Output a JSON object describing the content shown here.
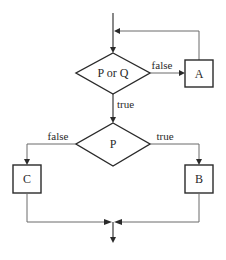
{
  "diagram": {
    "type": "flowchart",
    "nodes": {
      "decision_1": {
        "label": "P or Q",
        "shape": "diamond"
      },
      "decision_2": {
        "label": "P",
        "shape": "diamond"
      },
      "process_a": {
        "label": "A",
        "shape": "rectangle"
      },
      "process_b": {
        "label": "B",
        "shape": "rectangle"
      },
      "process_c": {
        "label": "C",
        "shape": "rectangle"
      }
    },
    "edges": {
      "d1_to_a": {
        "from": "P or Q",
        "to": "A",
        "label": "false"
      },
      "a_loop_back": {
        "from": "A",
        "to": "P or Q",
        "label": ""
      },
      "d1_to_d2": {
        "from": "P or Q",
        "to": "P",
        "label": "true"
      },
      "d2_to_c": {
        "from": "P",
        "to": "C",
        "label": "false"
      },
      "d2_to_b": {
        "from": "P",
        "to": "B",
        "label": "true"
      },
      "c_to_exit": {
        "from": "C",
        "to": "exit",
        "label": ""
      },
      "b_to_exit": {
        "from": "B",
        "to": "exit",
        "label": ""
      }
    }
  }
}
